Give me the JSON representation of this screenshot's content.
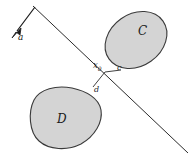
{
  "figure": {
    "type": "separating-hyperplane-diagram",
    "background_color": "#ffffff",
    "labels": {
      "set_c": "C",
      "set_d": "D",
      "point_c": "c",
      "point_d": "d",
      "point_x0": "x",
      "point_x0_sub": "0",
      "normal_vector": "a"
    },
    "colors": {
      "shape_fill": "#d4d4d4",
      "shape_stroke": "#3a3a3a",
      "line_stroke": "#2b2b2b",
      "label_color": "#1a1a1a"
    },
    "geometry": {
      "hyperplane": {
        "x1": 33,
        "y1": 6,
        "x2": 188,
        "y2": 153
      },
      "normal_arrow": {
        "x1": 35,
        "y1": 8,
        "x2": 14,
        "y2": 36
      },
      "support_segment": [
        {
          "x": 120,
          "y": 71
        },
        {
          "x": 105,
          "y": 72
        },
        {
          "x": 93,
          "y": 88
        }
      ],
      "set_c_center": {
        "cx": 136,
        "cy": 40,
        "rx": 33,
        "ry": 26,
        "rotation": -35
      },
      "set_d_center": {
        "cx": 65,
        "cy": 117,
        "rx": 36,
        "ry": 28,
        "rotation": -18
      }
    },
    "label_positions": {
      "set_c": {
        "x": 138,
        "y": 25
      },
      "set_d": {
        "x": 57,
        "y": 113
      },
      "point_c": {
        "x": 117,
        "y": 64
      },
      "point_d": {
        "x": 94,
        "y": 86
      },
      "point_x0": {
        "x": 93,
        "y": 61
      },
      "normal_vector": {
        "x": 18,
        "y": 35
      }
    }
  }
}
